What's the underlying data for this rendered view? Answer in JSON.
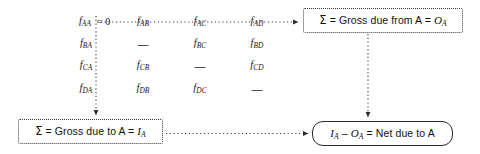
{
  "diagram": {
    "colors": {
      "background": "#ffffff",
      "text": "#111111",
      "line": "#3b3b3b",
      "solid_border": "#2b2b2b"
    }
  },
  "matrix": {
    "rows": [
      {
        "row_label": "A",
        "cells": [
          {
            "symbol": "f",
            "sub": "AA",
            "annotation": "= 0",
            "kind": "flow"
          },
          {
            "symbol": "f",
            "sub": "AB",
            "annotation": "",
            "kind": "flow"
          },
          {
            "symbol": "f",
            "sub": "AC",
            "annotation": "",
            "kind": "flow"
          },
          {
            "symbol": "f",
            "sub": "AD",
            "annotation": "",
            "kind": "flow"
          }
        ]
      },
      {
        "row_label": "B",
        "cells": [
          {
            "symbol": "f",
            "sub": "BA",
            "annotation": "",
            "kind": "flow"
          },
          {
            "symbol": "—",
            "sub": "",
            "annotation": "",
            "kind": "dash"
          },
          {
            "symbol": "f",
            "sub": "BC",
            "annotation": "",
            "kind": "flow"
          },
          {
            "symbol": "f",
            "sub": "BD",
            "annotation": "",
            "kind": "flow"
          }
        ]
      },
      {
        "row_label": "C",
        "cells": [
          {
            "symbol": "f",
            "sub": "CA",
            "annotation": "",
            "kind": "flow"
          },
          {
            "symbol": "f",
            "sub": "CB",
            "annotation": "",
            "kind": "flow"
          },
          {
            "symbol": "—",
            "sub": "",
            "annotation": "",
            "kind": "dash"
          },
          {
            "symbol": "f",
            "sub": "CD",
            "annotation": "",
            "kind": "flow"
          }
        ]
      },
      {
        "row_label": "D",
        "cells": [
          {
            "symbol": "f",
            "sub": "DA",
            "annotation": "",
            "kind": "flow"
          },
          {
            "symbol": "f",
            "sub": "DB",
            "annotation": "",
            "kind": "flow"
          },
          {
            "symbol": "f",
            "sub": "DC",
            "annotation": "",
            "kind": "flow"
          },
          {
            "symbol": "—",
            "sub": "",
            "annotation": "",
            "kind": "dash"
          }
        ]
      }
    ],
    "cell_text": {
      "r0c0": "f",
      "r0c0s": "AA",
      "r0c0n": "= 0",
      "r0c1": "f",
      "r0c1s": "AB",
      "r0c2": "f",
      "r0c2s": "AC",
      "r0c3": "f",
      "r0c3s": "AD",
      "r1c0": "f",
      "r1c0s": "BA",
      "r1c1": "—",
      "r1c2": "f",
      "r1c2s": "BC",
      "r1c3": "f",
      "r1c3s": "BD",
      "r2c0": "f",
      "r2c0s": "CA",
      "r2c1": "f",
      "r2c1s": "CB",
      "r2c2": "—",
      "r2c3": "f",
      "r2c3s": "CD",
      "r3c0": "f",
      "r3c0s": "DA",
      "r3c1": "f",
      "r3c1s": "DB",
      "r3c2": "f",
      "r3c2s": "DC",
      "r3c3": "—"
    }
  },
  "nodes": {
    "gross_from": {
      "sigma": "Σ",
      "text_before": " = Gross due from A = ",
      "var": "O",
      "var_sub": "A",
      "full_text": "Σ = Gross due from A = O_A",
      "border": "dotted"
    },
    "gross_to": {
      "sigma": "Σ",
      "text_before": " = Gross due to A = ",
      "var": "I",
      "var_sub": "A",
      "full_text": "Σ = Gross due to A = I_A",
      "border": "dotted"
    },
    "net": {
      "var1": "I",
      "var1_sub": "A",
      "minus": " – ",
      "var2": "O",
      "var2_sub": "A",
      "text_after": " = Net due to A",
      "full_text": "I_A – O_A = Net due to A",
      "border": "solid"
    }
  },
  "connectors": [
    {
      "name": "row-a-to-gross-from",
      "from": "matrix row A",
      "to": "gross_from box",
      "style": "dotted",
      "arrow": "right"
    },
    {
      "name": "column-a-to-gross-to",
      "from": "matrix column A",
      "to": "gross_to box",
      "style": "dotted",
      "arrow": "down"
    },
    {
      "name": "gross-from-to-net",
      "from": "gross_from box",
      "to": "net box",
      "style": "dotted",
      "arrow": "down"
    },
    {
      "name": "gross-to-to-net",
      "from": "gross_to box",
      "to": "net box",
      "style": "dotted",
      "arrow": "right"
    }
  ]
}
